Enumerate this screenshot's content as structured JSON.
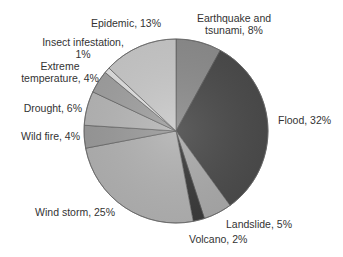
{
  "chart_data": {
    "type": "pie",
    "title": "",
    "start_angle_deg": 0,
    "direction": "clockwise",
    "slices": [
      {
        "label": "Earthquake and tsunami",
        "value": 8,
        "color": "#8e8e8e",
        "text_lines": [
          "Earthquake and",
          "tsunami, 8%"
        ],
        "label_x": 234,
        "label_y": 22,
        "anchor": "middle"
      },
      {
        "label": "Flood",
        "value": 32,
        "color": "#4c4c4c",
        "text_lines": [
          "Flood, 32%"
        ],
        "label_x": 278,
        "label_y": 124,
        "anchor": "start"
      },
      {
        "label": "Landslide",
        "value": 5,
        "color": "#ababab",
        "text_lines": [
          "Landslide, 5%"
        ],
        "label_x": 226,
        "label_y": 228,
        "anchor": "start"
      },
      {
        "label": "Volcano",
        "value": 2,
        "color": "#3c3c3c",
        "text_lines": [
          "Volcano, 2%"
        ],
        "label_x": 189,
        "label_y": 243,
        "anchor": "start"
      },
      {
        "label": "Wind storm",
        "value": 25,
        "color": "#b3b3b3",
        "text_lines": [
          "Wind storm, 25%"
        ],
        "label_x": 115,
        "label_y": 216,
        "anchor": "end"
      },
      {
        "label": "Wild fire",
        "value": 4,
        "color": "#9c9c9c",
        "text_lines": [
          "Wild fire, 4%"
        ],
        "label_x": 80,
        "label_y": 140,
        "anchor": "end"
      },
      {
        "label": "Drought",
        "value": 6,
        "color": "#b8b8b8",
        "text_lines": [
          "Drought, 6%"
        ],
        "label_x": 82,
        "label_y": 112,
        "anchor": "end"
      },
      {
        "label": "Extreme temperature",
        "value": 4,
        "color": "#a2a2a2",
        "text_lines": [
          "Extreme",
          "temperature, 4%"
        ],
        "label_x": 60,
        "label_y": 70,
        "anchor": "middle"
      },
      {
        "label": "Insect infestation",
        "value": 1,
        "color": "#e2e2e2",
        "text_lines": [
          "Insect infestation,",
          "1%"
        ],
        "label_x": 83,
        "label_y": 46,
        "anchor": "middle"
      },
      {
        "label": "Epidemic",
        "value": 13,
        "color": "#cacaca",
        "text_lines": [
          "Epidemic, 13%"
        ],
        "label_x": 126,
        "label_y": 27,
        "anchor": "middle"
      }
    ],
    "categories": [
      "Earthquake and tsunami",
      "Flood",
      "Landslide",
      "Volcano",
      "Wind storm",
      "Wild fire",
      "Drought",
      "Extreme temperature",
      "Insect infestation",
      "Epidemic"
    ],
    "values": [
      8,
      32,
      5,
      2,
      25,
      4,
      6,
      4,
      1,
      13
    ],
    "unit": "%",
    "legend": "none (direct labels)",
    "center": [
      176,
      131
    ],
    "radius": 92
  }
}
